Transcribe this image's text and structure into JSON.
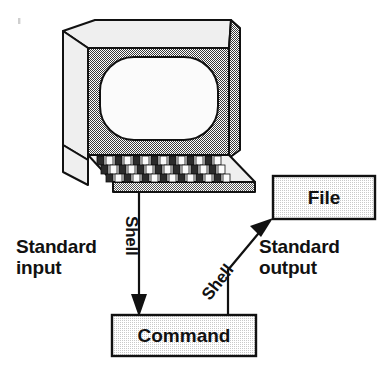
{
  "diagram": {
    "colors": {
      "ink": "#111111",
      "background": "#ffffff",
      "box_fill": "#eaeaea",
      "monitor_light": "#efefef",
      "monitor_bezel": "#9a9a9a",
      "screen": "#fbfbfb",
      "keyboard_key_dark": "#2b2b2b"
    },
    "labels": {
      "standard_input": "Standard\ninput",
      "standard_output": "Standard\noutput",
      "shell_input": "Shell",
      "shell_output": "Shell"
    },
    "nodes": [
      {
        "id": "terminal",
        "name": "terminal",
        "label": ""
      },
      {
        "id": "command",
        "name": "command-box",
        "label": "Command"
      },
      {
        "id": "file",
        "name": "file-box",
        "label": "File"
      }
    ],
    "edges": [
      {
        "id": "edge-input",
        "from": "terminal",
        "to": "command",
        "label": "Shell",
        "side_label": "Standard input",
        "direction": "down"
      },
      {
        "id": "edge-output",
        "from": "command",
        "to": "file",
        "label": "Shell",
        "side_label": "Standard output",
        "direction": "up-right"
      }
    ]
  }
}
